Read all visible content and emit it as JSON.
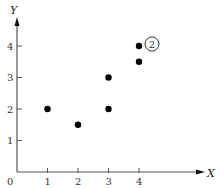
{
  "chart_data": {
    "type": "scatter",
    "title": "",
    "xlabel": "X",
    "ylabel": "Y",
    "origin_label": "0",
    "x_ticks": [
      "1",
      "2",
      "3",
      "4"
    ],
    "y_ticks": [
      "1",
      "2",
      "3",
      "4"
    ],
    "xlim": [
      0,
      6.5
    ],
    "ylim": [
      0,
      5
    ],
    "grid": false,
    "points": [
      {
        "x": 1,
        "y": 2
      },
      {
        "x": 2,
        "y": 1.5
      },
      {
        "x": 3,
        "y": 2
      },
      {
        "x": 3,
        "y": 3
      },
      {
        "x": 4,
        "y": 3.5
      },
      {
        "x": 4,
        "y": 4
      }
    ],
    "annotations": [
      {
        "text": "2",
        "style": "circled",
        "near_point": {
          "x": 4,
          "y": 4
        }
      }
    ],
    "colors": {
      "points": "#000000",
      "axes": "#555555"
    }
  }
}
